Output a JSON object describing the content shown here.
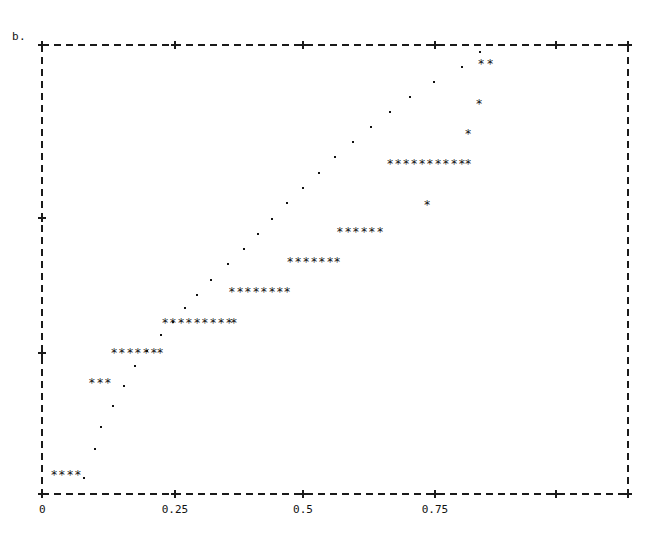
{
  "figure": {
    "panel_label": "b.",
    "background_color": "#ffffff",
    "frame_color": "#1a1a1a",
    "marker_color": "#111111"
  },
  "axes": {
    "x_ticks": [
      {
        "value": 0,
        "label": "0",
        "px": 42
      },
      {
        "value": 0.25,
        "label": "0.25",
        "px": 175
      },
      {
        "value": 0.5,
        "label": "0.5",
        "px": 303
      },
      {
        "value": 0.75,
        "label": "0.75",
        "px": 435
      },
      {
        "value": 1.0,
        "label": "",
        "px": 556
      }
    ],
    "y_ticks": [
      {
        "label": "",
        "px": 45
      },
      {
        "label": "",
        "px": 218
      },
      {
        "label": "",
        "px": 353
      },
      {
        "label": "",
        "px": 494
      }
    ],
    "xlim_px": [
      42,
      628
    ],
    "ylim_px": [
      45,
      494
    ],
    "xlabel": "",
    "ylabel": "",
    "grid": false
  },
  "chart_data": {
    "type": "scatter",
    "title": "b.",
    "xlabel": "",
    "ylabel": "",
    "xlim": [
      0,
      1
    ],
    "ylim": [
      0,
      1
    ],
    "grid": false,
    "legend": "none",
    "xtick_labels": [
      "0",
      "0.25",
      "0.5",
      "0.75"
    ],
    "xtick_values": [
      0,
      0.25,
      0.5,
      0.75
    ],
    "ytick_labels": [
      "",
      "",
      "",
      ""
    ],
    "series": [
      {
        "name": "asterisk-runs",
        "marker": "*",
        "points": [
          {
            "x": 0.0205,
            "y": 0.0423
          },
          {
            "x": 0.0341,
            "y": 0.0423
          },
          {
            "x": 0.0478,
            "y": 0.0423
          },
          {
            "x": 0.0614,
            "y": 0.0423
          },
          {
            "x": 0.0853,
            "y": 0.2472
          },
          {
            "x": 0.099,
            "y": 0.2472
          },
          {
            "x": 0.1126,
            "y": 0.2472
          },
          {
            "x": 0.1229,
            "y": 0.314
          },
          {
            "x": 0.1365,
            "y": 0.314
          },
          {
            "x": 0.1502,
            "y": 0.314
          },
          {
            "x": 0.1638,
            "y": 0.314
          },
          {
            "x": 0.1775,
            "y": 0.314
          },
          {
            "x": 0.1911,
            "y": 0.314
          },
          {
            "x": 0.2014,
            "y": 0.314
          },
          {
            "x": 0.2099,
            "y": 0.3809
          },
          {
            "x": 0.2235,
            "y": 0.3809
          },
          {
            "x": 0.2372,
            "y": 0.3809
          },
          {
            "x": 0.2508,
            "y": 0.3809
          },
          {
            "x": 0.2645,
            "y": 0.3809
          },
          {
            "x": 0.2781,
            "y": 0.3809
          },
          {
            "x": 0.2918,
            "y": 0.3809
          },
          {
            "x": 0.3055,
            "y": 0.3809
          },
          {
            "x": 0.3191,
            "y": 0.3809
          },
          {
            "x": 0.3276,
            "y": 0.3809
          },
          {
            "x": 0.3242,
            "y": 0.4499
          },
          {
            "x": 0.3379,
            "y": 0.4499
          },
          {
            "x": 0.3515,
            "y": 0.4499
          },
          {
            "x": 0.3652,
            "y": 0.4499
          },
          {
            "x": 0.3788,
            "y": 0.4499
          },
          {
            "x": 0.3925,
            "y": 0.4499
          },
          {
            "x": 0.4061,
            "y": 0.4499
          },
          {
            "x": 0.4181,
            "y": 0.4499
          },
          {
            "x": 0.4232,
            "y": 0.5167
          },
          {
            "x": 0.4369,
            "y": 0.5167
          },
          {
            "x": 0.4505,
            "y": 0.5167
          },
          {
            "x": 0.4642,
            "y": 0.5167
          },
          {
            "x": 0.4778,
            "y": 0.5167
          },
          {
            "x": 0.4915,
            "y": 0.5167
          },
          {
            "x": 0.5034,
            "y": 0.5167
          },
          {
            "x": 0.5085,
            "y": 0.5835
          },
          {
            "x": 0.5222,
            "y": 0.5835
          },
          {
            "x": 0.5358,
            "y": 0.5835
          },
          {
            "x": 0.5495,
            "y": 0.5835
          },
          {
            "x": 0.5631,
            "y": 0.5835
          },
          {
            "x": 0.5768,
            "y": 0.5835
          },
          {
            "x": 0.5939,
            "y": 0.7349
          },
          {
            "x": 0.6075,
            "y": 0.7349
          },
          {
            "x": 0.6212,
            "y": 0.7349
          },
          {
            "x": 0.6348,
            "y": 0.7349
          },
          {
            "x": 0.6485,
            "y": 0.7349
          },
          {
            "x": 0.6621,
            "y": 0.7349
          },
          {
            "x": 0.6758,
            "y": 0.7349
          },
          {
            "x": 0.6894,
            "y": 0.7349
          },
          {
            "x": 0.7031,
            "y": 0.7349
          },
          {
            "x": 0.7167,
            "y": 0.7349
          },
          {
            "x": 0.727,
            "y": 0.7349
          },
          {
            "x": 0.657,
            "y": 0.6436
          },
          {
            "x": 0.727,
            "y": 0.8018
          },
          {
            "x": 0.7458,
            "y": 0.8686
          },
          {
            "x": 0.7492,
            "y": 0.9577
          },
          {
            "x": 0.7646,
            "y": 0.9577
          }
        ]
      },
      {
        "name": "dot-trail",
        "marker": ".",
        "points": [
          {
            "x": 0.0717,
            "y": 0.0356
          },
          {
            "x": 0.0905,
            "y": 0.1002
          },
          {
            "x": 0.1007,
            "y": 0.1492
          },
          {
            "x": 0.1212,
            "y": 0.196
          },
          {
            "x": 0.1399,
            "y": 0.2405
          },
          {
            "x": 0.1587,
            "y": 0.2851
          },
          {
            "x": 0.1792,
            "y": 0.3185
          },
          {
            "x": 0.2031,
            "y": 0.3541
          },
          {
            "x": 0.2235,
            "y": 0.3831
          },
          {
            "x": 0.244,
            "y": 0.4143
          },
          {
            "x": 0.2645,
            "y": 0.4433
          },
          {
            "x": 0.2884,
            "y": 0.4766
          },
          {
            "x": 0.3174,
            "y": 0.5123
          },
          {
            "x": 0.3447,
            "y": 0.5457
          },
          {
            "x": 0.3686,
            "y": 0.5791
          },
          {
            "x": 0.3925,
            "y": 0.6125
          },
          {
            "x": 0.4181,
            "y": 0.648
          },
          {
            "x": 0.4454,
            "y": 0.6814
          },
          {
            "x": 0.4727,
            "y": 0.7148
          },
          {
            "x": 0.5,
            "y": 0.7505
          },
          {
            "x": 0.5307,
            "y": 0.7839
          },
          {
            "x": 0.5614,
            "y": 0.8173
          },
          {
            "x": 0.5939,
            "y": 0.8507
          },
          {
            "x": 0.628,
            "y": 0.8841
          },
          {
            "x": 0.6689,
            "y": 0.9175
          },
          {
            "x": 0.7167,
            "y": 0.951
          },
          {
            "x": 0.7475,
            "y": 0.9844
          }
        ]
      }
    ]
  }
}
